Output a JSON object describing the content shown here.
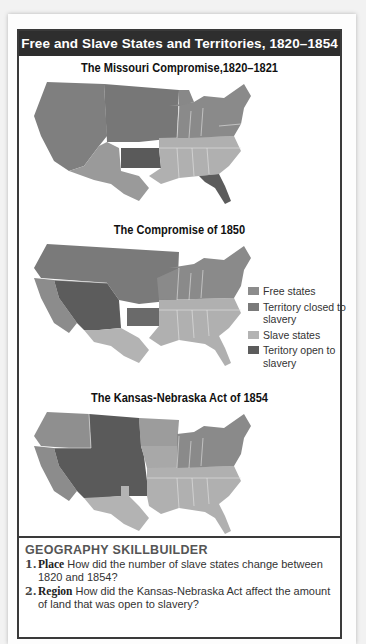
{
  "header": {
    "title": "Free and Slave States and Territories, 1820–1854"
  },
  "maps": [
    {
      "title": "The Missouri Compromise,1820–1821"
    },
    {
      "title": "The Compromise of 1850"
    },
    {
      "title": "The Kansas-Nebraska Act of 1854"
    }
  ],
  "legend": {
    "items": [
      {
        "label": "Free states",
        "color": "#8c8c8c"
      },
      {
        "label": "Territory closed to slavery",
        "color": "#7a7a7a"
      },
      {
        "label": "Slave states",
        "color": "#b3b3b3"
      },
      {
        "label": "Teritory open to slavery",
        "color": "#5c5c5c"
      }
    ]
  },
  "skillbuilder": {
    "heading": "GEOGRAPHY SKILLBUILDER",
    "questions": [
      {
        "num": "1.",
        "keyword": "Place",
        "text": "How did the number of slave states change between 1820 and 1854?"
      },
      {
        "num": "2.",
        "keyword": "Region",
        "text": "How did the Kansas-Nebraska Act affect the amount of land that was open to slavery?"
      }
    ]
  }
}
